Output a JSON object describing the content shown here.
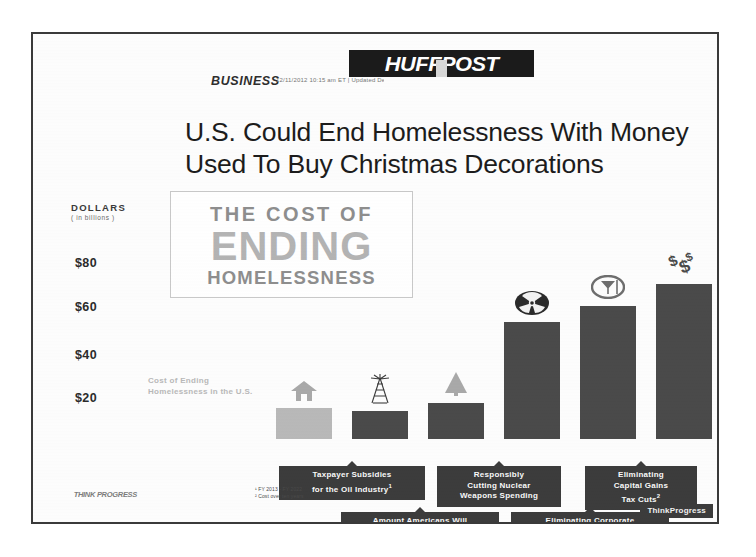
{
  "publication": {
    "logo_text": "HUFFPOST",
    "section": "BUSINESS",
    "byline": "12/11/2012 10:15 am ET | Updated Dec 11, 2012"
  },
  "headline": "U.S. Could End Homelessness With Money Used To Buy Christmas Decorations",
  "infographic": {
    "title_line1": "THE COST OF",
    "title_line2": "ENDING",
    "title_line3": "HOMELESSNESS",
    "source_logo": "THINK PROGRESS",
    "watermark": "ThinkProgress",
    "footnotes": [
      "¹ FY 2013 - FY 2022",
      "² Cost over ten years"
    ]
  },
  "axis": {
    "title": "DOLLARS",
    "subtitle": "( in billions )",
    "ticks": [
      {
        "label": "$80",
        "value": 80
      },
      {
        "label": "$60",
        "value": 60
      },
      {
        "label": "$40",
        "value": 40
      },
      {
        "label": "$20",
        "value": 20
      }
    ]
  },
  "chart_data": {
    "type": "bar",
    "title": "The Cost of Ending Homelessness",
    "xlabel": "",
    "ylabel": "DOLLARS ( in billions )",
    "ylim": [
      0,
      88
    ],
    "grid": false,
    "legend": "none",
    "categories": [
      "Cost of Ending Homelessness in the U.S.",
      "Taxpayer Subsidies for the Oil Industry",
      "Amount Americans Will Spend on Christmas Decorations & Flowers",
      "Responsibly Cutting Nuclear Weapons Spending",
      "Eliminating Corporate Meals & Entertainment Write-Offs",
      "Eliminating Capital Gains Tax Cuts"
    ],
    "values": [
      20,
      19,
      22,
      62,
      68,
      80
    ]
  },
  "bars": [
    {
      "caption": "Cost of Ending Homelessness in the U.S.",
      "label": "",
      "footnote": "",
      "value": 20,
      "color": "#b9b9b9",
      "icon": "house-icon",
      "icon_color": "#a9a9a9",
      "left": 133,
      "width": 56,
      "top": 224
    },
    {
      "caption": "",
      "label": "Taxpayer Subsidies\nfor the Oil Industry",
      "footnote": "1",
      "value": 19,
      "color": "#4a4a4a",
      "icon": "oil-derrick-icon",
      "icon_color": "#3c3c3c",
      "left": 209,
      "width": 56,
      "top": 227
    },
    {
      "caption": "",
      "label": "Amount Americans Will\nSpend on Christmas\nDecorations & Flowers",
      "footnote": "",
      "value": 22,
      "color": "#4a4a4a",
      "icon": "christmas-tree-icon",
      "icon_color": "#a9a9a9",
      "left": 285,
      "width": 56,
      "top": 219
    },
    {
      "caption": "",
      "label": "Responsibly\nCutting Nuclear\nWeapons Spending",
      "footnote": "",
      "value": 62,
      "color": "#4a4a4a",
      "icon": "radiation-icon",
      "icon_color": "#2a2a2a",
      "left": 361,
      "width": 56,
      "top": 138
    },
    {
      "caption": "",
      "label": "Eliminating Corporate\nMeals & Entertainment\nWrite-Offs",
      "footnote": "",
      "value": 68,
      "color": "#4a4a4a",
      "icon": "martini-icon",
      "icon_color": "#6e6e6e",
      "left": 437,
      "width": 56,
      "top": 122
    },
    {
      "caption": "",
      "label": "Eliminating\nCapital Gains\nTax Cuts",
      "footnote": "2",
      "value": 80,
      "color": "#4a4a4a",
      "icon": "dollar-signs-icon",
      "icon_color": "#4a4a4a",
      "left": 513,
      "width": 56,
      "top": 100
    }
  ],
  "labels_row_top": [
    {
      "index": 1,
      "left": 246,
      "top": 432,
      "width": 146,
      "text_key": 1
    },
    {
      "index": 3,
      "left": 404,
      "top": 432,
      "width": 124,
      "text_key": 3
    },
    {
      "index": 5,
      "left": 552,
      "top": 432,
      "width": 112,
      "text_key": 5
    }
  ],
  "labels_row_bottom": [
    {
      "index": 2,
      "left": 308,
      "top": 478,
      "width": 158,
      "text_key": 2
    },
    {
      "index": 4,
      "left": 478,
      "top": 478,
      "width": 158,
      "text_key": 4
    }
  ],
  "colors": {
    "frame": "#3a3a3a",
    "dark_bar": "#4a4a4a",
    "light_bar": "#b9b9b9",
    "label_bg": "#3c3c3c",
    "brand_black": "#1b1b1b",
    "page_bg": "#ffffff"
  }
}
